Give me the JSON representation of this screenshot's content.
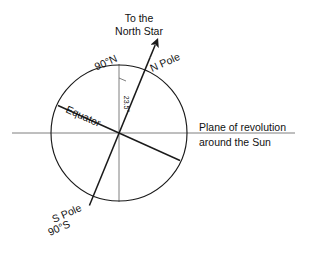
{
  "diagram": {
    "labels": {
      "north_star_line1": "To the",
      "north_star_line2": "North Star",
      "north_pole_degrees": "90°N",
      "north_pole_name": "N Pole",
      "tilt_angle": "23.5°",
      "equator": "Equator",
      "plane_line1": "Plane of revolution",
      "plane_line2": "around the Sun",
      "south_pole_name": "S Pole",
      "south_pole_degrees": "90°S"
    },
    "colors": {
      "stroke_dark": "#1a1a1a",
      "stroke_light": "#6f6f6f",
      "background": "#ffffff",
      "text": "#111111"
    },
    "geometry": {
      "center_x": 119,
      "center_y": 133,
      "radius": 68,
      "tilt_degrees": 23.5,
      "arrow_tip_x": 156,
      "arrow_tip_y": 41,
      "plane_left_x": 12,
      "plane_right_x": 295
    }
  }
}
